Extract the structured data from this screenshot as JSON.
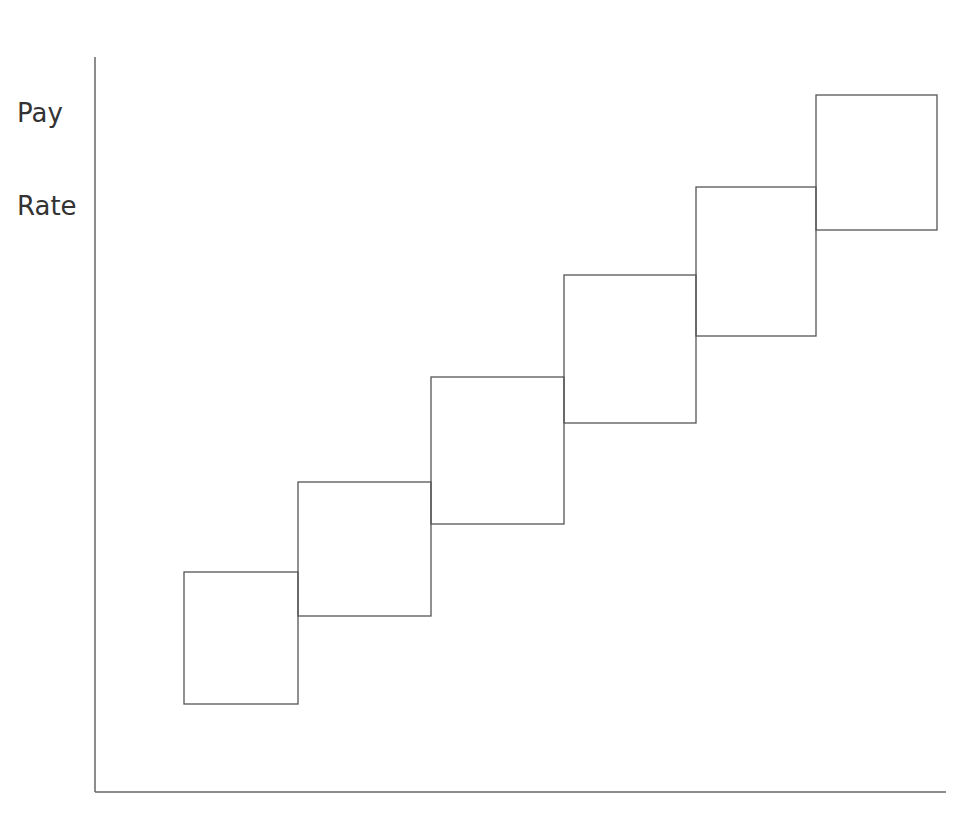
{
  "chart_data": {
    "type": "range-bar",
    "title": "",
    "xlabel": "",
    "ylabel": "Pay Rate",
    "ylabel_lines": [
      "Pay",
      "Rate"
    ],
    "grid": false,
    "legend": null,
    "categories": [
      "Grade 1",
      "Grade 2",
      "Grade 3",
      "Grade 4",
      "Grade 5",
      "Grade 6"
    ],
    "category_labels_visible": false,
    "series": [
      {
        "name": "Pay range",
        "ranges": [
          {
            "min": 0.12,
            "max": 0.3
          },
          {
            "min": 0.24,
            "max": 0.42
          },
          {
            "min": 0.36,
            "max": 0.56
          },
          {
            "min": 0.5,
            "max": 0.7
          },
          {
            "min": 0.62,
            "max": 0.82
          },
          {
            "min": 0.76,
            "max": 0.95
          }
        ]
      }
    ],
    "ylim": [
      0,
      1
    ],
    "tick_labels_visible": false,
    "colors": {
      "stroke": "#555555",
      "axis": "#666666",
      "background": "#ffffff"
    }
  },
  "axes": {
    "origin": [
      95,
      792
    ],
    "y_top": 57,
    "x_right": 946
  },
  "boxes": [
    {
      "x": 184,
      "y": 572,
      "w": 114,
      "h": 132
    },
    {
      "x": 298,
      "y": 482,
      "w": 133,
      "h": 134
    },
    {
      "x": 431,
      "y": 377,
      "w": 133,
      "h": 147
    },
    {
      "x": 564,
      "y": 275,
      "w": 132,
      "h": 148
    },
    {
      "x": 696,
      "y": 187,
      "w": 120,
      "h": 149
    },
    {
      "x": 816,
      "y": 95,
      "w": 121,
      "h": 135
    }
  ]
}
